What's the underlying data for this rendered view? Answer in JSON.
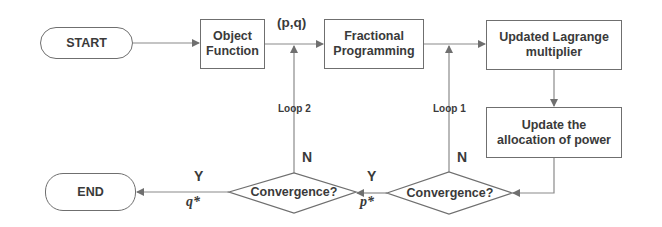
{
  "diagram": {
    "nodes": {
      "start": "START",
      "object_function": "Object Function",
      "fractional_programming": "Fractional Programming",
      "updated_lagrange": "Updated Lagrange multiplier",
      "update_power": "Update the allocation of power",
      "convergence_inner": "Convergence?",
      "convergence_outer": "Convergence?",
      "end": "END"
    },
    "labels": {
      "pq": "(p,q)",
      "loop1": "Loop 1",
      "loop2": "Loop 2",
      "n_inner": "N",
      "n_outer": "N",
      "y_inner": "Y",
      "y_outer": "Y",
      "p_star": "p*",
      "q_star": "q*"
    },
    "edges": [
      {
        "from": "start",
        "to": "object_function"
      },
      {
        "from": "object_function",
        "to": "fractional_programming",
        "label": "(p,q)"
      },
      {
        "from": "fractional_programming",
        "to": "updated_lagrange"
      },
      {
        "from": "updated_lagrange",
        "to": "update_power"
      },
      {
        "from": "update_power",
        "to": "convergence_inner"
      },
      {
        "from": "convergence_inner",
        "to": "fractional_programming",
        "label": "N / Loop 1"
      },
      {
        "from": "convergence_inner",
        "to": "convergence_outer",
        "label": "Y, p*"
      },
      {
        "from": "convergence_outer",
        "to": "object_function",
        "label": "N / Loop 2"
      },
      {
        "from": "convergence_outer",
        "to": "end",
        "label": "Y, q*"
      }
    ],
    "colors": {
      "stroke": "#6f6f6f",
      "text": "#3a3a3a",
      "background": "#ffffff"
    }
  }
}
